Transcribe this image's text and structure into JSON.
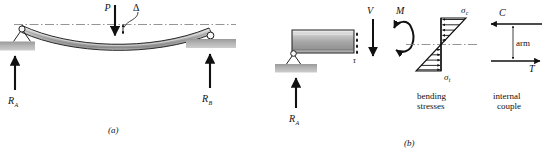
{
  "figure": {
    "panels": [
      {
        "id": "a",
        "caption": "(a)",
        "description": "Simply supported beam with central point load P and deflection delta"
      },
      {
        "id": "b",
        "caption": "(b)",
        "description": "Free body diagram of left beam segment with shear V, moment M, bending stresses and internal couple"
      }
    ]
  },
  "panel_a": {
    "load_label": "P",
    "deflection_label": "Δ",
    "reaction_left": "R",
    "reaction_left_sub": "A",
    "reaction_right": "R",
    "reaction_right_sub": "B",
    "caption": "(a)"
  },
  "panel_b": {
    "reaction_left": "R",
    "reaction_left_sub": "A",
    "shear_label": "V",
    "moment_label": "M",
    "shear_stress_label": "τ",
    "caption": "(b)",
    "stress_block": {
      "sigma_c": "σ",
      "sigma_c_sub": "c",
      "sigma_t": "σ",
      "sigma_t_sub": "t",
      "caption_line1": "bending",
      "caption_line2": "stresses"
    },
    "couple_block": {
      "compression_label": "C",
      "tension_label": "T",
      "arm_label": "arm",
      "caption_line1": "internal",
      "caption_line2": "couple"
    }
  },
  "colors": {
    "ink": "#111111",
    "beam_fill_light": "#e6e6e6",
    "beam_fill_mid": "#b8b8b8",
    "beam_fill_dark": "#8f8f8f",
    "ground_fill": "#a9a9a9",
    "centerline": "#777777"
  }
}
